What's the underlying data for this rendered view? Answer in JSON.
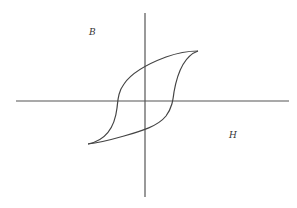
{
  "diagram": {
    "type": "hysteresis-loop",
    "axes": {
      "vertical_label": "B",
      "horizontal_label": "H"
    },
    "colors": {
      "line": "#444444",
      "background": "#ffffff",
      "label": "#333333"
    }
  }
}
